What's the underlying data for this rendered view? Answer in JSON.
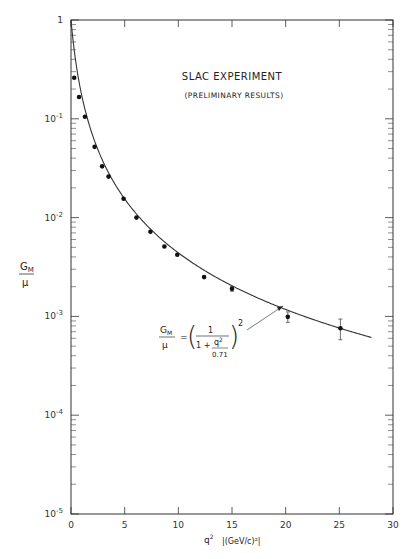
{
  "chart_data": {
    "type": "scatter",
    "title": "SLAC EXPERIMENT",
    "subtitle": "(PRELIMINARY RESULTS)",
    "xlabel": "q² |(GeV/c)²|",
    "xlabel_main": "q",
    "xlabel_sup": "2",
    "xlabel_units": "|(GeV/c)²|",
    "ylabel_num": "G",
    "ylabel_sub": "M",
    "ylabel_den": "μ",
    "xlim": [
      0,
      30
    ],
    "ylim": [
      1e-05,
      1
    ],
    "yscale": "log",
    "x_ticks": [
      "0",
      "5",
      "10",
      "15",
      "20",
      "25",
      "30"
    ],
    "y_ticks": [
      {
        "base": "1",
        "exp": ""
      },
      {
        "base": "10",
        "exp": "-1"
      },
      {
        "base": "10",
        "exp": "-2"
      },
      {
        "base": "10",
        "exp": "-3"
      },
      {
        "base": "10",
        "exp": "-4"
      },
      {
        "base": "10",
        "exp": "-5"
      }
    ],
    "grid": false,
    "series": [
      {
        "name": "SLAC data",
        "style": "points",
        "x": [
          0.3,
          0.75,
          1.3,
          2.2,
          2.9,
          3.5,
          4.9,
          6.1,
          7.4,
          8.7,
          9.9,
          12.4,
          15.0,
          20.2,
          25.1
        ],
        "y": [
          0.26,
          0.166,
          0.105,
          0.052,
          0.033,
          0.026,
          0.0155,
          0.01,
          0.0072,
          0.0051,
          0.0042,
          0.0025,
          0.0019,
          0.00099,
          0.00076
        ],
        "yerr": [
          0,
          0,
          0,
          0,
          0,
          0,
          0,
          0,
          0,
          0,
          0,
          0,
          0.0001,
          0.00012,
          0.00018
        ]
      },
      {
        "name": "Dipole fit",
        "style": "line",
        "formula": "GM/μ = (1 / (1 + q²/0.71))²",
        "x_range": [
          0,
          28
        ]
      }
    ],
    "annotation": {
      "lhs_num": "G",
      "lhs_sub": "M",
      "lhs_den": "μ",
      "equals": "=",
      "open": "(",
      "numerator": "1",
      "denominator_prefix": "1 +",
      "inner_num": "q",
      "inner_sup": "2",
      "inner_den": "0.71",
      "close": ")",
      "power": "2"
    }
  }
}
